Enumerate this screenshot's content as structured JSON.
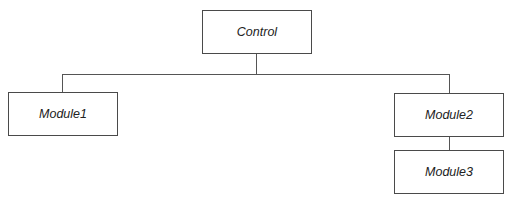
{
  "diagram": {
    "type": "hierarchy",
    "nodes": [
      {
        "id": "control",
        "label": "Control",
        "x": 202,
        "y": 10,
        "w": 110,
        "h": 44
      },
      {
        "id": "module1",
        "label": "Module1",
        "x": 8,
        "y": 92,
        "w": 110,
        "h": 44
      },
      {
        "id": "module2",
        "label": "Module2",
        "x": 394,
        "y": 93,
        "w": 110,
        "h": 44
      },
      {
        "id": "module3",
        "label": "Module3",
        "x": 394,
        "y": 150,
        "w": 110,
        "h": 44
      }
    ],
    "edges": [
      {
        "from": "control",
        "to": "module1"
      },
      {
        "from": "control",
        "to": "module2"
      },
      {
        "from": "module2",
        "to": "module3"
      }
    ],
    "line_color": "#555555",
    "border_color": "#4a4a4a"
  }
}
